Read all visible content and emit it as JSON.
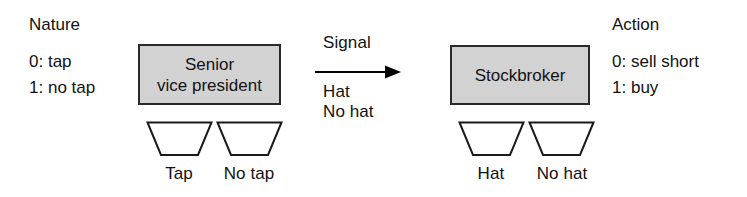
{
  "diagram": {
    "colors": {
      "box_fill": "#d2d2d2",
      "box_stroke": "#2a2a2a",
      "text": "#121212",
      "background": "#ffffff",
      "trapezoid_stroke": "#1a1a1a",
      "arrow": "#000000"
    }
  },
  "nature": {
    "heading": "Nature",
    "types": [
      {
        "index": "0:",
        "label": "tap"
      },
      {
        "index": "1:",
        "label": "no tap"
      }
    ]
  },
  "action": {
    "heading": "Action",
    "choices": [
      {
        "index": "0:",
        "label": "sell short"
      },
      {
        "index": "1:",
        "label": "buy"
      }
    ]
  },
  "sender": {
    "name_line_1": "Senior",
    "name_line_2": "vice president",
    "information_sets": [
      {
        "label": "Tap"
      },
      {
        "label": "No tap"
      }
    ]
  },
  "receiver": {
    "name_line_1": "Stockbroker",
    "information_sets": [
      {
        "label": "Hat"
      },
      {
        "label": "No hat"
      }
    ]
  },
  "signal": {
    "heading": "Signal",
    "options": [
      {
        "label": "Hat"
      },
      {
        "label": "No hat"
      }
    ]
  }
}
